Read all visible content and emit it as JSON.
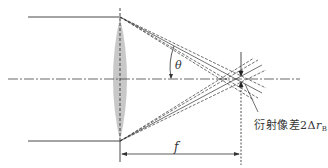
{
  "diagram": {
    "labels": {
      "angle": "θ",
      "focal_length": "f",
      "caption_text": "衍射像差2Δ",
      "caption_var": "r",
      "caption_sub": "B"
    },
    "colors": {
      "line": "#333333",
      "lens_fill": "#c8c8c8",
      "background": "#ffffff"
    },
    "elements": [
      "incoming parallel rays (top and bottom)",
      "converging lens",
      "optical axis (dash-dot)",
      "lens plane (dashed)",
      "focal plane (dashed)",
      "converging ray bundles",
      "focal length dimension arrow",
      "angle θ arc",
      "diffraction spot indicator arrows"
    ]
  }
}
